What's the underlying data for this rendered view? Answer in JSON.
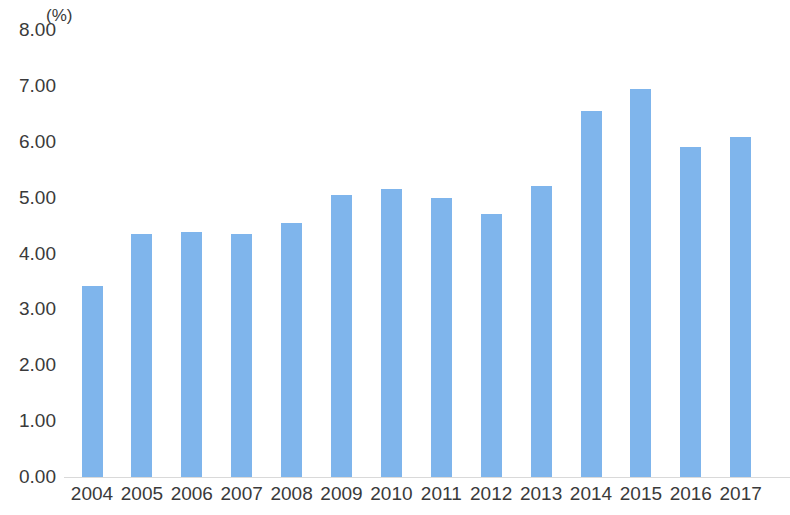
{
  "chart_data": {
    "type": "bar",
    "title": "",
    "subtitle": "",
    "unit_label": "(%)",
    "xlabel": "",
    "ylabel": "",
    "categories": [
      "2004",
      "2005",
      "2006",
      "2007",
      "2008",
      "2009",
      "2010",
      "2011",
      "2012",
      "2013",
      "2014",
      "2015",
      "2016",
      "2017"
    ],
    "values": [
      3.42,
      4.35,
      4.39,
      4.35,
      4.55,
      5.05,
      5.16,
      5.0,
      4.7,
      5.2,
      6.55,
      6.95,
      5.9,
      6.08
    ],
    "ylim": [
      0.0,
      8.0
    ],
    "ytick_step": 1.0,
    "ytick_labels": [
      "8.00",
      "7.00",
      "6.00",
      "5.00",
      "4.00",
      "3.00",
      "2.00",
      "1.00",
      "0.00"
    ],
    "ytick_values": [
      8,
      7,
      6,
      5,
      4,
      3,
      2,
      1,
      0
    ],
    "grid": false,
    "baseline_visible": true,
    "legend": null,
    "legend_position": "none",
    "series": [
      {
        "name": "",
        "color": "#7fb5ec",
        "values": [
          3.42,
          4.35,
          4.39,
          4.35,
          4.55,
          5.05,
          5.16,
          5.0,
          4.7,
          5.2,
          6.55,
          6.95,
          5.9,
          6.08
        ]
      }
    ],
    "colors": {
      "bar": "#7fb5ec",
      "axis_text": "#3a3a3a",
      "baseline": "#d9d9d9",
      "background": "#ffffff"
    }
  }
}
